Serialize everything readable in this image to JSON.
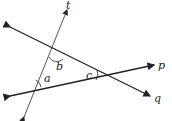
{
  "diagram": {
    "type": "geometry-transversal",
    "lines": [
      {
        "id": "t",
        "label": "t",
        "x1": 24,
        "y1": 117,
        "x2": 67,
        "y2": 10
      },
      {
        "id": "q",
        "label": "q",
        "x1": 10,
        "y1": 27,
        "x2": 150,
        "y2": 96
      },
      {
        "id": "p",
        "label": "p",
        "x1": 10,
        "y1": 96,
        "x2": 154,
        "y2": 65
      }
    ],
    "angles": [
      {
        "label": "a",
        "vertex": "t∩p"
      },
      {
        "label": "b",
        "vertex": "t∩q"
      },
      {
        "label": "c",
        "vertex": "q∩p"
      }
    ],
    "colors": {
      "line": "#222222",
      "transversal": "#555555",
      "background": "#ffffff"
    }
  }
}
